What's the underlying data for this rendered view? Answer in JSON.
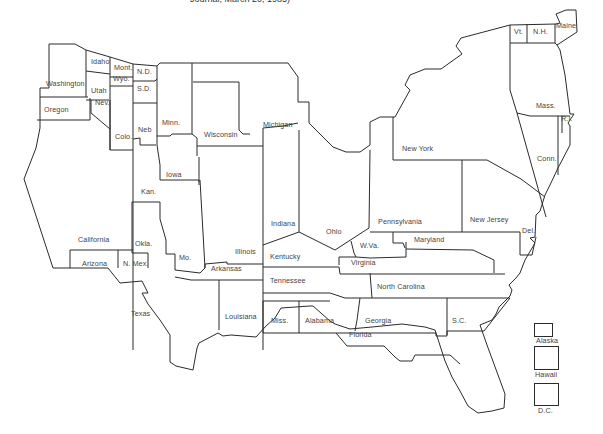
{
  "caption": "Journal, March 20, 1985)",
  "map": {
    "title": "United States state map (distorted cartogram)",
    "states": [
      {
        "name": "Washington",
        "label": "Washington",
        "x": 46,
        "y": 85
      },
      {
        "name": "Oregon",
        "label": "Oregon",
        "x": 44,
        "y": 111
      },
      {
        "name": "Idaho",
        "label": "Idaho",
        "x": 91,
        "y": 63
      },
      {
        "name": "Utah",
        "label": "Utah",
        "x": 91,
        "y": 92
      },
      {
        "name": "Nev",
        "label": "Nev.",
        "x": 95,
        "y": 104
      },
      {
        "name": "Mont",
        "label": "Mont.",
        "x": 114,
        "y": 69
      },
      {
        "name": "Wyo",
        "label": "Wyo.",
        "x": 113,
        "y": 80
      },
      {
        "name": "ND",
        "label": "N.D.",
        "x": 137,
        "y": 73
      },
      {
        "name": "SD",
        "label": "S.D.",
        "x": 137,
        "y": 90
      },
      {
        "name": "Colo",
        "label": "Colo.",
        "x": 115,
        "y": 138
      },
      {
        "name": "Neb",
        "label": "Neb",
        "x": 138,
        "y": 131
      },
      {
        "name": "Minn",
        "label": "Minn.",
        "x": 162,
        "y": 124
      },
      {
        "name": "Wisconsin",
        "label": "Wisconsin",
        "x": 204,
        "y": 136
      },
      {
        "name": "Michigan",
        "label": "Michigan",
        "x": 263,
        "y": 126
      },
      {
        "name": "Iowa",
        "label": "Iowa",
        "x": 166,
        "y": 176
      },
      {
        "name": "Kan",
        "label": "Kan.",
        "x": 141,
        "y": 193
      },
      {
        "name": "Okla",
        "label": "Okla.",
        "x": 135,
        "y": 245
      },
      {
        "name": "California",
        "label": "California",
        "x": 78,
        "y": 241
      },
      {
        "name": "Arizona",
        "label": "Arizona",
        "x": 82,
        "y": 265
      },
      {
        "name": "NMex",
        "label": "N. Mex.",
        "x": 123,
        "y": 265
      },
      {
        "name": "Mo",
        "label": "Mo.",
        "x": 179,
        "y": 259
      },
      {
        "name": "Illinois",
        "label": "Illinois",
        "x": 235,
        "y": 253
      },
      {
        "name": "Arkansas",
        "label": "Arkansas",
        "x": 211,
        "y": 270
      },
      {
        "name": "Indiana",
        "label": "Indiana",
        "x": 271,
        "y": 225
      },
      {
        "name": "Ohio",
        "label": "Ohio",
        "x": 326,
        "y": 233
      },
      {
        "name": "Kentucky",
        "label": "Kentucky",
        "x": 270,
        "y": 258
      },
      {
        "name": "Tennessee",
        "label": "Tennessee",
        "x": 270,
        "y": 282
      },
      {
        "name": "WVa",
        "label": "W.Va.",
        "x": 360,
        "y": 247
      },
      {
        "name": "Pennsylvania",
        "label": "Pennsylvania",
        "x": 378,
        "y": 223
      },
      {
        "name": "Maryland",
        "label": "Maryland",
        "x": 414,
        "y": 241
      },
      {
        "name": "Virginia",
        "label": "Virginia",
        "x": 351,
        "y": 264
      },
      {
        "name": "NewYork",
        "label": "New York",
        "x": 402,
        "y": 150
      },
      {
        "name": "NewJersey",
        "label": "New Jersey",
        "x": 470,
        "y": 221
      },
      {
        "name": "Del",
        "label": "Del.",
        "x": 522,
        "y": 232
      },
      {
        "name": "NorthCarolina",
        "label": "North Carolina",
        "x": 377,
        "y": 288
      },
      {
        "name": "Louisiana",
        "label": "Louisiana",
        "x": 225,
        "y": 318
      },
      {
        "name": "Miss",
        "label": "Miss.",
        "x": 271,
        "y": 322
      },
      {
        "name": "Alabama",
        "label": "Alabama",
        "x": 305,
        "y": 322
      },
      {
        "name": "Georgia",
        "label": "Georgia",
        "x": 365,
        "y": 322
      },
      {
        "name": "SC",
        "label": "S.C.",
        "x": 452,
        "y": 322
      },
      {
        "name": "Florida",
        "label": "Florida",
        "x": 349,
        "y": 336
      },
      {
        "name": "Texas",
        "label": "Texas",
        "x": 131,
        "y": 315
      },
      {
        "name": "Vt",
        "label": "Vt.",
        "x": 514,
        "y": 33
      },
      {
        "name": "NH",
        "label": "N.H.",
        "x": 533,
        "y": 33
      },
      {
        "name": "Maine",
        "label": "Maine",
        "x": 556,
        "y": 27
      },
      {
        "name": "Mass",
        "label": "Mass.",
        "x": 536,
        "y": 107
      },
      {
        "name": "RI",
        "label": "R.I.",
        "x": 561,
        "y": 120
      },
      {
        "name": "Conn",
        "label": "Conn.",
        "x": 537,
        "y": 160
      }
    ]
  },
  "legend": {
    "items": [
      {
        "name": "Alaska",
        "label": "Alaska"
      },
      {
        "name": "Hawaii",
        "label": "Hawaii"
      },
      {
        "name": "DC",
        "label": "D.C."
      }
    ]
  }
}
